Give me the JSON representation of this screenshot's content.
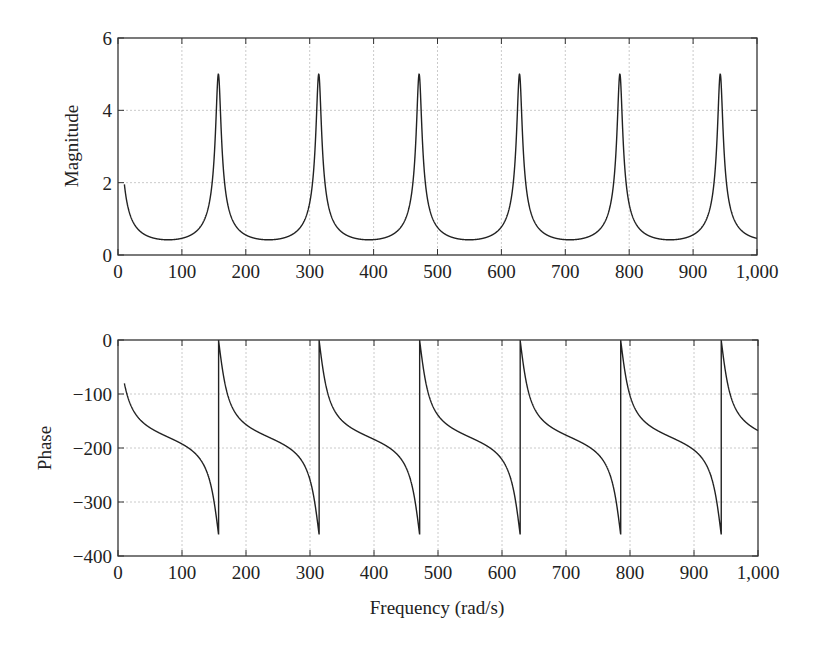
{
  "chart_data": [
    {
      "type": "line",
      "title": "",
      "xlabel": "",
      "ylabel": "Magnitude",
      "xlim": [
        0,
        1000
      ],
      "ylim": [
        0,
        6
      ],
      "grid": true,
      "legend": null,
      "xticks": [
        0,
        100,
        200,
        300,
        400,
        500,
        600,
        700,
        800,
        900,
        1000
      ],
      "xtick_labels": [
        "0",
        "100",
        "200",
        "300",
        "400",
        "500",
        "600",
        "700",
        "800",
        "900",
        "1,000"
      ],
      "yticks": [
        0,
        2,
        4,
        6
      ],
      "ytick_labels": [
        "0",
        "2",
        "4",
        "6"
      ],
      "annotations": [
        "Resonance peaks of height ~5 at multiples of ~157 rad/s (157, 314, 471, 628, 785, 942)",
        "Minimum ~0.42 midway between peaks"
      ],
      "series": [
        {
          "name": "Magnitude",
          "x": [
            10,
            40,
            78.5,
            120,
            140,
            150,
            157,
            164,
            175,
            200,
            235.5,
            280,
            300,
            314,
            330,
            360,
            392.5,
            440,
            460,
            471,
            485,
            520,
            549.5,
            600,
            615,
            628,
            642,
            670,
            706.5,
            760,
            775,
            785,
            797,
            830,
            863.5,
            920,
            932,
            942,
            954,
            980,
            1000
          ],
          "values": [
            1.86,
            0.62,
            0.42,
            0.62,
            1.05,
            2.0,
            5.0,
            2.0,
            0.98,
            0.56,
            0.42,
            0.55,
            0.85,
            5.0,
            1.0,
            0.52,
            0.42,
            0.62,
            1.15,
            5.0,
            1.15,
            0.5,
            0.42,
            0.65,
            1.3,
            5.0,
            1.2,
            0.52,
            0.42,
            0.7,
            1.4,
            5.0,
            1.2,
            0.5,
            0.42,
            0.85,
            1.95,
            5.0,
            1.7,
            0.6,
            0.47
          ]
        }
      ]
    },
    {
      "type": "line",
      "title": "",
      "xlabel": "Frequency (rad/s)",
      "ylabel": "Phase",
      "xlim": [
        0,
        1000
      ],
      "ylim": [
        -400,
        0
      ],
      "grid": true,
      "legend": null,
      "xticks": [
        0,
        100,
        200,
        300,
        400,
        500,
        600,
        700,
        800,
        900,
        1000
      ],
      "xtick_labels": [
        "0",
        "100",
        "200",
        "300",
        "400",
        "500",
        "600",
        "700",
        "800",
        "900",
        "1,000"
      ],
      "yticks": [
        -400,
        -300,
        -200,
        -100,
        0
      ],
      "ytick_labels": [
        "−400",
        "−300",
        "−200",
        "−100",
        "0"
      ],
      "annotations": [
        "Phase wraps from ~-360 to 0 at each resonance (~157 rad/s period)"
      ],
      "series": [
        {
          "name": "Phase",
          "x": [
            10,
            40,
            78.5,
            100,
            120,
            140,
            150,
            156.9,
            157.1,
            165,
            200,
            235.5,
            280,
            300,
            313.9,
            314.3,
            330,
            392.5,
            450,
            470.9,
            471.3,
            490,
            549.5,
            610,
            627.9,
            628.4,
            650,
            706.5,
            770,
            784.9,
            785.5,
            800,
            863.5,
            920,
            941.9,
            942.5,
            960,
            1000
          ],
          "values": [
            -80,
            -128,
            -180,
            -207,
            -234,
            -270,
            -305,
            -360,
            0,
            -70,
            -130,
            -180,
            -238,
            -280,
            -360,
            0,
            -80,
            -180,
            -255,
            -360,
            0,
            -90,
            -180,
            -262,
            -360,
            0,
            -95,
            -180,
            -265,
            -360,
            0,
            -85,
            -180,
            -262,
            -360,
            0,
            -80,
            -151
          ]
        }
      ]
    }
  ],
  "figure": {
    "top_plot": {
      "ylabel": "Magnitude",
      "xtick_labels": [
        "0",
        "100",
        "200",
        "300",
        "400",
        "500",
        "600",
        "700",
        "800",
        "900",
        "1,000"
      ],
      "ytick_labels": [
        "0",
        "2",
        "4",
        "6"
      ]
    },
    "bottom_plot": {
      "ylabel": "Phase",
      "xlabel": "Frequency (rad/s)",
      "xtick_labels": [
        "0",
        "100",
        "200",
        "300",
        "400",
        "500",
        "600",
        "700",
        "800",
        "900",
        "1,000"
      ],
      "ytick_labels": [
        "−400",
        "−300",
        "−200",
        "−100",
        "0"
      ]
    },
    "model": {
      "period_rad_s": 157.08,
      "mag_gain": 0.775,
      "mag_pole": 0.845,
      "phase_k": 0.24,
      "x_start": 10,
      "x_end": 1000
    },
    "colors": {
      "line": "#222222",
      "axis": "#333333",
      "grid": "#bdbdbd",
      "background": "#ffffff"
    }
  }
}
